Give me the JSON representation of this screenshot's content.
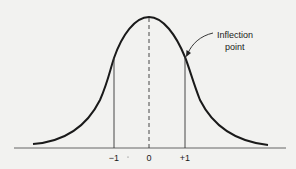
{
  "diagram": {
    "type": "normal-distribution-curve",
    "annotation": {
      "line1": "Inflection",
      "line2": "point"
    },
    "ticks": [
      {
        "label": "−1",
        "x": 114
      },
      {
        "label": "0",
        "x": 149
      },
      {
        "label": "+1",
        "x": 185
      }
    ],
    "colors": {
      "background": "#f2f2f0",
      "stroke": "#1a1a1a"
    }
  }
}
